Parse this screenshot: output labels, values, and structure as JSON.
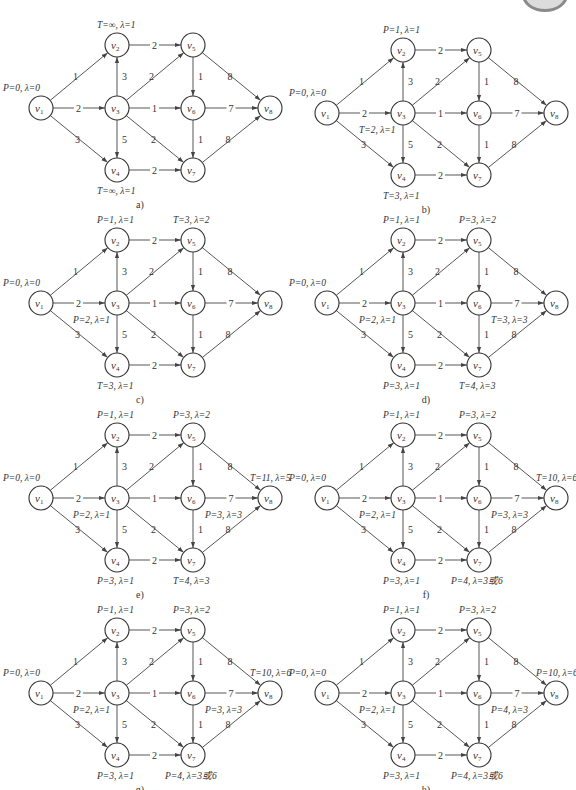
{
  "figure": {
    "caption": ""
  },
  "graph": {
    "nodes": [
      {
        "id": "v1",
        "label": "v",
        "sub": "1",
        "x": 41,
        "y": 108
      },
      {
        "id": "v2",
        "label": "v",
        "sub": "2",
        "x": 117,
        "y": 45
      },
      {
        "id": "v3",
        "label": "v",
        "sub": "3",
        "x": 117,
        "y": 108
      },
      {
        "id": "v4",
        "label": "v",
        "sub": "4",
        "x": 117,
        "y": 170
      },
      {
        "id": "v5",
        "label": "v",
        "sub": "5",
        "x": 193,
        "y": 45
      },
      {
        "id": "v6",
        "label": "v",
        "sub": "6",
        "x": 193,
        "y": 108
      },
      {
        "id": "v7",
        "label": "v",
        "sub": "7",
        "x": 193,
        "y": 170
      },
      {
        "id": "v8",
        "label": "v",
        "sub": "8",
        "x": 270,
        "y": 108
      }
    ],
    "edges": [
      {
        "from": "v1",
        "to": "v2",
        "w": "1"
      },
      {
        "from": "v1",
        "to": "v3",
        "w": "2"
      },
      {
        "from": "v1",
        "to": "v4",
        "w": "3"
      },
      {
        "from": "v3",
        "to": "v2",
        "w": "3"
      },
      {
        "from": "v3",
        "to": "v4",
        "w": "5"
      },
      {
        "from": "v2",
        "to": "v5",
        "w": "2"
      },
      {
        "from": "v3",
        "to": "v5",
        "w": "2"
      },
      {
        "from": "v3",
        "to": "v6",
        "w": "1"
      },
      {
        "from": "v3",
        "to": "v7",
        "w": "2"
      },
      {
        "from": "v4",
        "to": "v7",
        "w": "2"
      },
      {
        "from": "v5",
        "to": "v6",
        "w": "1"
      },
      {
        "from": "v6",
        "to": "v7",
        "w": "1"
      },
      {
        "from": "v5",
        "to": "v8",
        "w": "8"
      },
      {
        "from": "v6",
        "to": "v8",
        "w": "7"
      },
      {
        "from": "v7",
        "to": "v8",
        "w": "8"
      }
    ]
  },
  "panels": [
    {
      "id": "a",
      "caption": "a)",
      "ox": 0,
      "oy": 0,
      "annotations": [
        {
          "node": "v1",
          "text": "P=0, λ=0",
          "dx": -38,
          "dy": -17
        },
        {
          "node": "v2",
          "text": "T=∞, λ=1",
          "dx": -20,
          "dy": -17
        },
        {
          "node": "v4",
          "text": "T=∞, λ=1",
          "dx": -20,
          "dy": 24
        }
      ]
    },
    {
      "id": "b",
      "caption": "b)",
      "ox": 286,
      "oy": 5,
      "annotations": [
        {
          "node": "v1",
          "text": "P=0, λ=0",
          "dx": -38,
          "dy": -17
        },
        {
          "node": "v2",
          "text": "P=1, λ=1",
          "dx": -20,
          "dy": -17
        },
        {
          "node": "v3",
          "text": "T=2, λ=1",
          "dx": -44,
          "dy": 20
        },
        {
          "node": "v4",
          "text": "T=3, λ=1",
          "dx": -20,
          "dy": 24
        }
      ]
    },
    {
      "id": "c",
      "caption": "c)",
      "ox": 0,
      "oy": 195,
      "annotations": [
        {
          "node": "v1",
          "text": "P=0, λ=0",
          "dx": -38,
          "dy": -17
        },
        {
          "node": "v2",
          "text": "P=1, λ=1",
          "dx": -20,
          "dy": -17
        },
        {
          "node": "v3",
          "text": "P=2, λ=1",
          "dx": -44,
          "dy": 20
        },
        {
          "node": "v4",
          "text": "T=3, λ=1",
          "dx": -20,
          "dy": 24
        },
        {
          "node": "v5",
          "text": "T=3, λ=2",
          "dx": -20,
          "dy": -17
        }
      ]
    },
    {
      "id": "d",
      "caption": "d)",
      "ox": 286,
      "oy": 195,
      "annotations": [
        {
          "node": "v1",
          "text": "P=0, λ=0",
          "dx": -38,
          "dy": -17
        },
        {
          "node": "v2",
          "text": "P=1, λ=1",
          "dx": -20,
          "dy": -17
        },
        {
          "node": "v3",
          "text": "P=2, λ=1",
          "dx": -44,
          "dy": 20
        },
        {
          "node": "v4",
          "text": "P=3, λ=1",
          "dx": -20,
          "dy": 24
        },
        {
          "node": "v5",
          "text": "P=3, λ=2",
          "dx": -20,
          "dy": -17
        },
        {
          "node": "v6",
          "text": "T=3, λ=3",
          "dx": 12,
          "dy": 20
        },
        {
          "node": "v7",
          "text": "T=4, λ=3",
          "dx": -20,
          "dy": 24
        }
      ]
    },
    {
      "id": "e",
      "caption": "e)",
      "ox": 0,
      "oy": 390,
      "annotations": [
        {
          "node": "v1",
          "text": "P=0, λ=0",
          "dx": -38,
          "dy": -17
        },
        {
          "node": "v2",
          "text": "P=1, λ=1",
          "dx": -20,
          "dy": -17
        },
        {
          "node": "v3",
          "text": "P=2, λ=1",
          "dx": -44,
          "dy": 20
        },
        {
          "node": "v4",
          "text": "P=3, λ=1",
          "dx": -20,
          "dy": 24
        },
        {
          "node": "v5",
          "text": "P=3, λ=2",
          "dx": -20,
          "dy": -17
        },
        {
          "node": "v6",
          "text": "P=3, λ=3",
          "dx": 12,
          "dy": 20
        },
        {
          "node": "v7",
          "text": "T=4, λ=3",
          "dx": -20,
          "dy": 24
        },
        {
          "node": "v8",
          "text": "T=11, λ=5",
          "dx": -20,
          "dy": -17
        }
      ]
    },
    {
      "id": "f",
      "caption": "f)",
      "ox": 286,
      "oy": 390,
      "annotations": [
        {
          "node": "v1",
          "text": "P=0, λ=0",
          "dx": -38,
          "dy": -17
        },
        {
          "node": "v2",
          "text": "P=1, λ=1",
          "dx": -20,
          "dy": -17
        },
        {
          "node": "v3",
          "text": "P=2, λ=1",
          "dx": -44,
          "dy": 20
        },
        {
          "node": "v4",
          "text": "P=3, λ=1",
          "dx": -20,
          "dy": 24
        },
        {
          "node": "v5",
          "text": "P=3, λ=2",
          "dx": -20,
          "dy": -17
        },
        {
          "node": "v6",
          "text": "P=3, λ=3",
          "dx": 12,
          "dy": 20
        },
        {
          "node": "v7",
          "text": "P=4, λ=3或6",
          "dx": -28,
          "dy": 24
        },
        {
          "node": "v8",
          "text": "T=10, λ=6",
          "dx": -20,
          "dy": -17
        }
      ]
    },
    {
      "id": "g",
      "caption": "g)",
      "ox": 0,
      "oy": 585,
      "annotations": [
        {
          "node": "v1",
          "text": "P=0, λ=0",
          "dx": -38,
          "dy": -17
        },
        {
          "node": "v2",
          "text": "P=1, λ=1",
          "dx": -20,
          "dy": -17
        },
        {
          "node": "v3",
          "text": "P=2, λ=1",
          "dx": -44,
          "dy": 20
        },
        {
          "node": "v4",
          "text": "P=3, λ=1",
          "dx": -20,
          "dy": 24
        },
        {
          "node": "v5",
          "text": "P=3, λ=2",
          "dx": -20,
          "dy": -17
        },
        {
          "node": "v6",
          "text": "P=3, λ=3",
          "dx": 12,
          "dy": 20
        },
        {
          "node": "v7",
          "text": "P=4, λ=3或6",
          "dx": -28,
          "dy": 24
        },
        {
          "node": "v8",
          "text": "T=10, λ=6",
          "dx": -20,
          "dy": -17
        }
      ]
    },
    {
      "id": "h",
      "caption": "h)",
      "ox": 286,
      "oy": 585,
      "annotations": [
        {
          "node": "v1",
          "text": "P=0, λ=0",
          "dx": -38,
          "dy": -17
        },
        {
          "node": "v2",
          "text": "P=1, λ=1",
          "dx": -20,
          "dy": -17
        },
        {
          "node": "v3",
          "text": "P=2, λ=1",
          "dx": -44,
          "dy": 20
        },
        {
          "node": "v4",
          "text": "P=3, λ=1",
          "dx": -20,
          "dy": 24
        },
        {
          "node": "v5",
          "text": "P=3, λ=2",
          "dx": -20,
          "dy": -17
        },
        {
          "node": "v6",
          "text": "P=4, λ=3",
          "dx": 12,
          "dy": 20
        },
        {
          "node": "v7",
          "text": "P=4, λ=3或6",
          "dx": -28,
          "dy": 24
        },
        {
          "node": "v8",
          "text": "P=10, λ=6",
          "dx": -20,
          "dy": -17
        }
      ]
    }
  ]
}
